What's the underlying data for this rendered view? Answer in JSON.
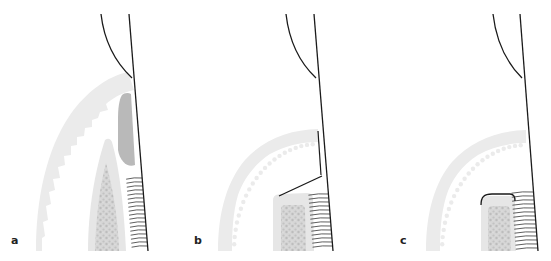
{
  "figure": {
    "type": "dental anatomical diagram, three-stage sequence",
    "colors": {
      "background": "#ffffff",
      "gingiva_outer": "#ebebeb",
      "bone_cortical": "#e4e4e4",
      "bone_cancellous": "#cfcfcf",
      "lesion_gray": "#b8b8b8",
      "line": "#1a1a1a"
    },
    "panels": [
      {
        "id": "a",
        "label": "a",
        "description": "Tooth root with periodontal fibers, crestal bone tapered, dark soft-tissue defect against root"
      },
      {
        "id": "b",
        "label": "b",
        "description": "Flat-topped bone crest with oblique line from bone edge to root surface"
      },
      {
        "id": "c",
        "label": "c",
        "description": "Flat-topped bone crest covered by a rounded outline (graft/membrane)"
      }
    ]
  }
}
